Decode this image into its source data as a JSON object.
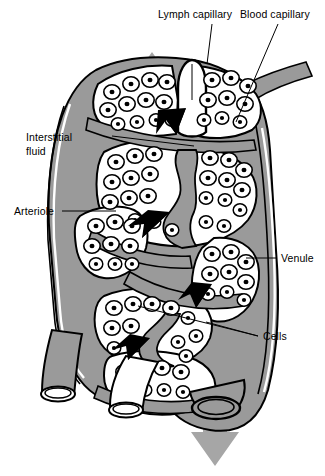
{
  "figure": {
    "width": 325,
    "height": 476,
    "background": "#ffffff"
  },
  "palette": {
    "vessel_gray": "#9a9a9a",
    "arrow_gray": "#a6a6a6",
    "outline_black": "#000000",
    "cell_fill": "#ffffff",
    "nucleus": "#000000",
    "lumen_white": "#ffffff",
    "label_text": "#000000"
  },
  "labels": [
    {
      "id": "lymph-capillary",
      "text": "Lymph capillary",
      "x": 158,
      "y": 14,
      "leader": "vertical"
    },
    {
      "id": "blood-capillary",
      "text": "Blood capillary",
      "x": 240,
      "y": 14,
      "leader": "diagonal"
    },
    {
      "id": "interstitial-fluid-line1",
      "text": "Interstitial",
      "x": 55,
      "y": 138,
      "leader": "horizontal"
    },
    {
      "id": "interstitial-fluid-line2",
      "text": "fluid",
      "x": 55,
      "y": 151,
      "leader": "none"
    },
    {
      "id": "arteriole",
      "text": "Arteriole",
      "x": 18,
      "y": 206,
      "leader": "horizontal"
    },
    {
      "id": "venule",
      "text": "Venule",
      "x": 280,
      "y": 254,
      "leader": "horizontal"
    },
    {
      "id": "cells",
      "text": "Cells",
      "x": 262,
      "y": 331,
      "leader": "forked"
    }
  ],
  "flow_arrows": [
    {
      "id": "lymph-flow-up",
      "direction": "up",
      "color": "#a6a6a6",
      "x": 152,
      "y": 52
    },
    {
      "id": "venous-flow-down",
      "direction": "down",
      "color": "#a6a6a6",
      "x": 215,
      "y": 425
    }
  ],
  "fluid_arrows": [
    {
      "id": "fluid-arrow-1",
      "x": 168,
      "y": 125,
      "note": "interstitial fluid entering lymph capillary"
    },
    {
      "id": "fluid-arrow-2",
      "x": 152,
      "y": 228,
      "note": "interstitial fluid movement"
    },
    {
      "id": "fluid-arrow-3",
      "x": 196,
      "y": 300,
      "note": "interstitial fluid movement"
    },
    {
      "id": "fluid-arrow-4",
      "x": 132,
      "y": 352,
      "note": "interstitial fluid movement"
    }
  ],
  "structures": [
    {
      "id": "lymph-capillary-vessel",
      "kind": "lymph capillary",
      "fill": "#ffffff"
    },
    {
      "id": "blood-capillary-vessel",
      "kind": "blood capillary",
      "fill": "#9a9a9a"
    },
    {
      "id": "arteriole-vessel",
      "kind": "arteriole",
      "fill": "#9a9a9a"
    },
    {
      "id": "venule-vessel",
      "kind": "venule",
      "fill": "#9a9a9a"
    },
    {
      "id": "interstitial-fluid-region",
      "kind": "interstitial fluid",
      "fill": "#9a9a9a"
    },
    {
      "id": "tissue-cells",
      "kind": "cells",
      "fill": "#ffffff"
    }
  ]
}
